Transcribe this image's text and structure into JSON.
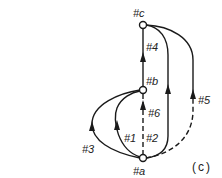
{
  "figure": {
    "caption": "(c)",
    "colors": {
      "stroke": "#1a1a1a",
      "node_fill": "#ffffff",
      "text": "#222222"
    }
  },
  "nodes": [
    {
      "id": "a",
      "label": "#a"
    },
    {
      "id": "b",
      "label": "#b"
    },
    {
      "id": "c",
      "label": "#c"
    }
  ],
  "edges": [
    {
      "id": "1",
      "label": "#1",
      "from": "a",
      "to": "b",
      "style": "solid",
      "shape": "curve-left-inner"
    },
    {
      "id": "2",
      "label": "#2",
      "from": "a",
      "to": "c",
      "style": "solid",
      "shape": "curve-right-inner"
    },
    {
      "id": "3",
      "label": "#3",
      "from": "a",
      "to": "b",
      "style": "solid",
      "shape": "curve-left-outer"
    },
    {
      "id": "4",
      "label": "#4",
      "from": "b",
      "to": "c",
      "style": "solid",
      "shape": "straight"
    },
    {
      "id": "5",
      "label": "#5",
      "from": "a",
      "to": "c",
      "style": "dashed-lower-solid-upper",
      "shape": "curve-right-outer"
    },
    {
      "id": "6",
      "label": "#6",
      "from": "a",
      "to": "b",
      "style": "dashed",
      "shape": "straight"
    }
  ]
}
